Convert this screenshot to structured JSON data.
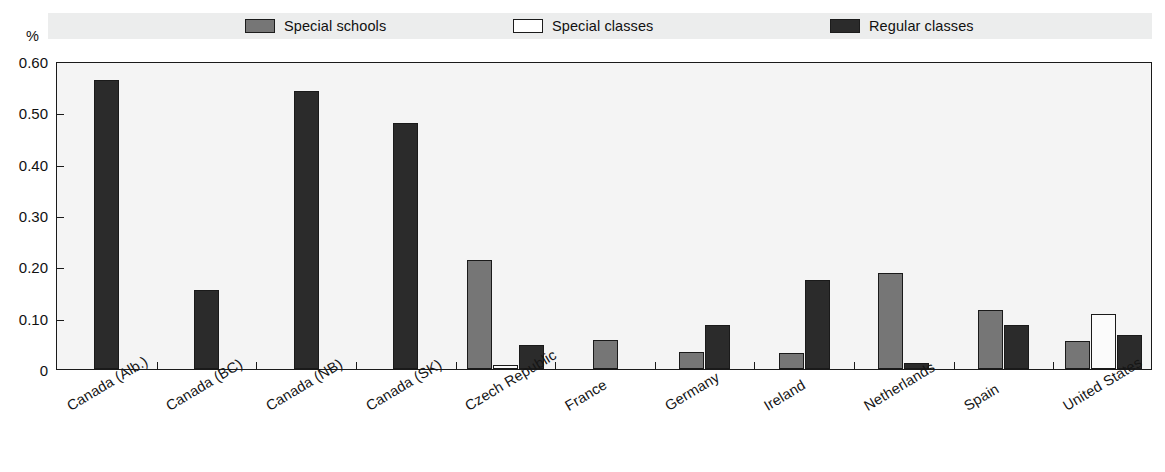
{
  "chart_data": {
    "type": "bar",
    "title": "",
    "xlabel": "",
    "ylabel": "%",
    "ylim": [
      0,
      0.6
    ],
    "ytick_labels": [
      "0.60",
      "0.50",
      "0.40",
      "0.30",
      "0.20",
      "0.10",
      "0"
    ],
    "ytick_values": [
      0.6,
      0.5,
      0.4,
      0.3,
      0.2,
      0.1,
      0
    ],
    "grid": false,
    "legend_position": "top",
    "categories": [
      "Canada (Alb.)",
      "Canada (BC)",
      "Canada (NB)",
      "Canada (SK)",
      "Czech Republic",
      "France",
      "Germany",
      "Ireland",
      "Netherlands",
      "Spain",
      "United States"
    ],
    "series": [
      {
        "name": "Special schools",
        "color": "#767676",
        "values": [
          null,
          null,
          null,
          null,
          0.212,
          0.057,
          0.033,
          0.031,
          0.188,
          0.115,
          0.055
        ]
      },
      {
        "name": "Special classes",
        "color": "#fbfbfb",
        "values": [
          null,
          null,
          null,
          null,
          0.008,
          null,
          null,
          null,
          null,
          null,
          0.108
        ]
      },
      {
        "name": "Regular classes",
        "color": "#2b2b2b",
        "values": [
          0.563,
          0.153,
          0.541,
          0.48,
          0.047,
          null,
          0.085,
          0.173,
          0.012,
          0.085,
          0.066
        ]
      }
    ]
  },
  "legend": {
    "entries": [
      {
        "label": "Special schools",
        "color": "#767676"
      },
      {
        "label": "Special classes",
        "color": "#fbfbfb"
      },
      {
        "label": "Regular classes",
        "color": "#2b2b2b"
      }
    ]
  },
  "axis": {
    "unit": "%"
  }
}
